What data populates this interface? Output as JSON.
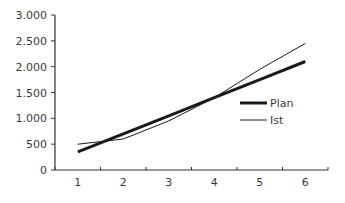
{
  "chart_data": {
    "type": "line",
    "title": "",
    "xlabel": "",
    "ylabel": "",
    "categories": [
      "1",
      "2",
      "3",
      "4",
      "5",
      "6"
    ],
    "series": [
      {
        "name": "Plan",
        "values": [
          350,
          700,
          1050,
          1400,
          1750,
          2100
        ],
        "line_width": 3,
        "color": "#1a1a1a"
      },
      {
        "name": "Ist",
        "values": [
          500,
          600,
          950,
          1400,
          1950,
          2450
        ],
        "line_width": 1,
        "color": "#1a1a1a"
      }
    ],
    "ylim": [
      0,
      3000
    ],
    "yticks": [
      0,
      500,
      1000,
      1500,
      2000,
      2500,
      3000
    ],
    "ytick_labels": [
      "0",
      "500",
      "1.000",
      "1.500",
      "2.000",
      "2.500",
      "3.000"
    ],
    "grid": false,
    "legend_position": "right-inside"
  }
}
